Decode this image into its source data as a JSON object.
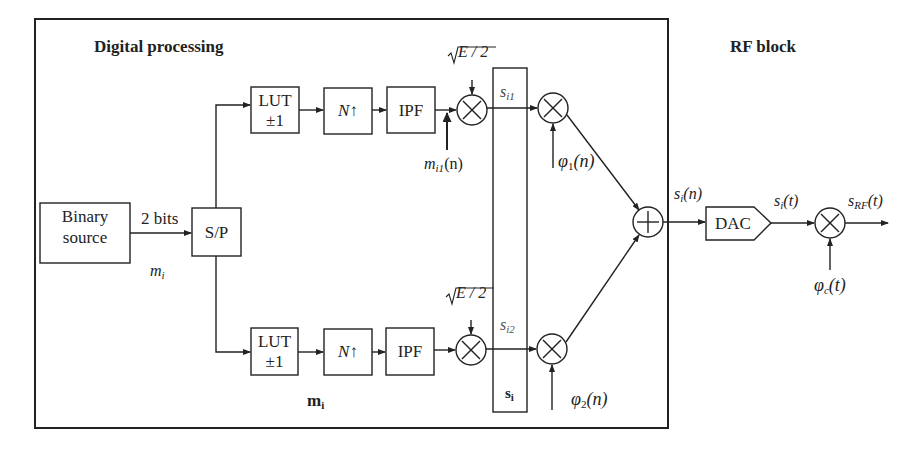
{
  "sections": {
    "digital_title": "Digital processing",
    "rf_title": "RF block"
  },
  "blocks": {
    "binary_source": [
      "Binary",
      "source"
    ],
    "sp": "S/P",
    "lut_top": [
      "LUT",
      "±1"
    ],
    "up_top": "N↑",
    "ipf_top": "IPF",
    "lut_bot": [
      "LUT",
      "±1"
    ],
    "up_bot": "N↑",
    "ipf_bot": "IPF",
    "dac": "DAC"
  },
  "signals": {
    "two_bits": "2 bits",
    "m_i": "m",
    "m_i_sub": "i",
    "m_vec": "m",
    "m_vec_sub": "i",
    "sqrt_top": "√E / 2",
    "sqrt_bot": "√E / 2",
    "m_i1": "m",
    "m_i1_sub": "i1",
    "m_i1_arg": "(n)",
    "s_i1": "s",
    "s_i1_sub": "i1",
    "s_i2": "s",
    "s_i2_sub": "i2",
    "s_vec": "s",
    "s_vec_sub": "i",
    "phi1": "φ",
    "phi1_sub": "1",
    "phi1_arg": "(n)",
    "phi2": "φ",
    "phi2_sub": "2",
    "phi2_arg": "(n)",
    "si_n": "s",
    "si_n_sub": "i",
    "si_n_arg": "(n)",
    "si_t": "s",
    "si_t_sub": "i",
    "si_t_arg": "(t)",
    "srf": "s",
    "srf_sub": "RF",
    "srf_arg": "(t)",
    "phic": "φ",
    "phic_sub": "c",
    "phic_arg": "(t)"
  },
  "operators": {
    "multiply": "×",
    "add": "+"
  },
  "colors": {
    "line": "#222222",
    "background": "#ffffff"
  }
}
